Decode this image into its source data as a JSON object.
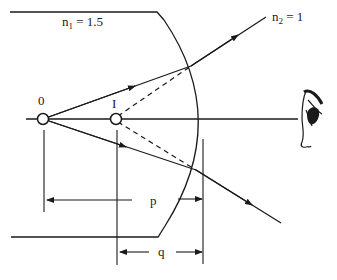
{
  "diagram": {
    "type": "refraction-at-spherical-surface",
    "labels": {
      "medium1": "n",
      "medium1_sub": "1",
      "medium1_value": " = 1.5",
      "medium2": "n",
      "medium2_sub": "2",
      "medium2_value": " = 1",
      "object": "0",
      "image": "I",
      "object_distance": "p",
      "image_distance": "q"
    },
    "points": {
      "object": {
        "x": 43,
        "y": 119
      },
      "image": {
        "x": 116,
        "y": 119
      },
      "upper_refraction": {
        "x": 191,
        "y": 66
      },
      "lower_refraction": {
        "x": 196,
        "y": 170
      }
    },
    "elements": [
      "glass-rod",
      "curved-surface",
      "optical-axis",
      "rays",
      "virtual-ray-extensions",
      "observer-eye",
      "distance-markers"
    ]
  }
}
